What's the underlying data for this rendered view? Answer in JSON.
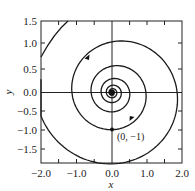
{
  "chart_data": {
    "type": "line",
    "title": "",
    "xlabel": "x",
    "ylabel": "y",
    "xlim": [
      -2.0,
      2.0
    ],
    "ylim": [
      -1.95,
      1.5
    ],
    "grid": false,
    "legend": null,
    "x_ticks": [
      "-2.0",
      "-1.0",
      "0.0",
      "1.0",
      "2.0"
    ],
    "x_tick_values": [
      -2.0,
      -1.0,
      0.0,
      1.0,
      2.0
    ],
    "y_ticks": [
      "1.5",
      "1.0",
      "0.5",
      "0.0",
      "-0.5",
      "-1.0",
      "-1.5"
    ],
    "y_tick_values": [
      1.5,
      1.0,
      0.5,
      0.0,
      -0.5,
      -1.0,
      -1.5
    ],
    "reference_lines": {
      "horizontal": 0.0,
      "vertical": 0.0
    },
    "series": [
      {
        "name": "trajectory",
        "description": "phase-plane spiral trajectory through (0,-1), spiraling inward counterclockwise to the origin",
        "key_points": [
          {
            "x": -2.0,
            "y": -0.95
          },
          {
            "x": -0.3,
            "y": -1.92
          },
          {
            "x": 1.6,
            "y": 0.0
          },
          {
            "x": 0.2,
            "y": 0.95
          },
          {
            "x": -1.15,
            "y": 0.0
          },
          {
            "x": 0.0,
            "y": -1.0
          },
          {
            "x": 0.85,
            "y": 0.0
          },
          {
            "x": 0.0,
            "y": 0.55
          },
          {
            "x": -0.6,
            "y": 0.0
          },
          {
            "x": 0.0,
            "y": -0.35
          },
          {
            "x": 0.0,
            "y": 0.0
          }
        ],
        "outer_branch": [
          {
            "x": -2.0,
            "y": 0.75
          },
          {
            "x": -1.55,
            "y": 1.5
          }
        ],
        "arrows": [
          {
            "x": -0.75,
            "y": 0.75,
            "direction": "down-left"
          },
          {
            "x": 0.6,
            "y": -0.72,
            "direction": "up-right"
          }
        ]
      }
    ],
    "annotations": [
      {
        "text": "(0, −1)",
        "x": 0.0,
        "y": -1.0,
        "marker": "dot"
      }
    ]
  },
  "labels": {
    "x_axis_title": "x",
    "y_axis_title": "y",
    "point_label": "(0, −1)",
    "x_ticks": [
      "−2.0",
      "−1.0",
      "0.0",
      "1.0",
      "2.0"
    ],
    "y_ticks": [
      "1.5",
      "1.0",
      "0.5",
      "0.0",
      "−0.5",
      "−1.0",
      "−1.5"
    ]
  }
}
